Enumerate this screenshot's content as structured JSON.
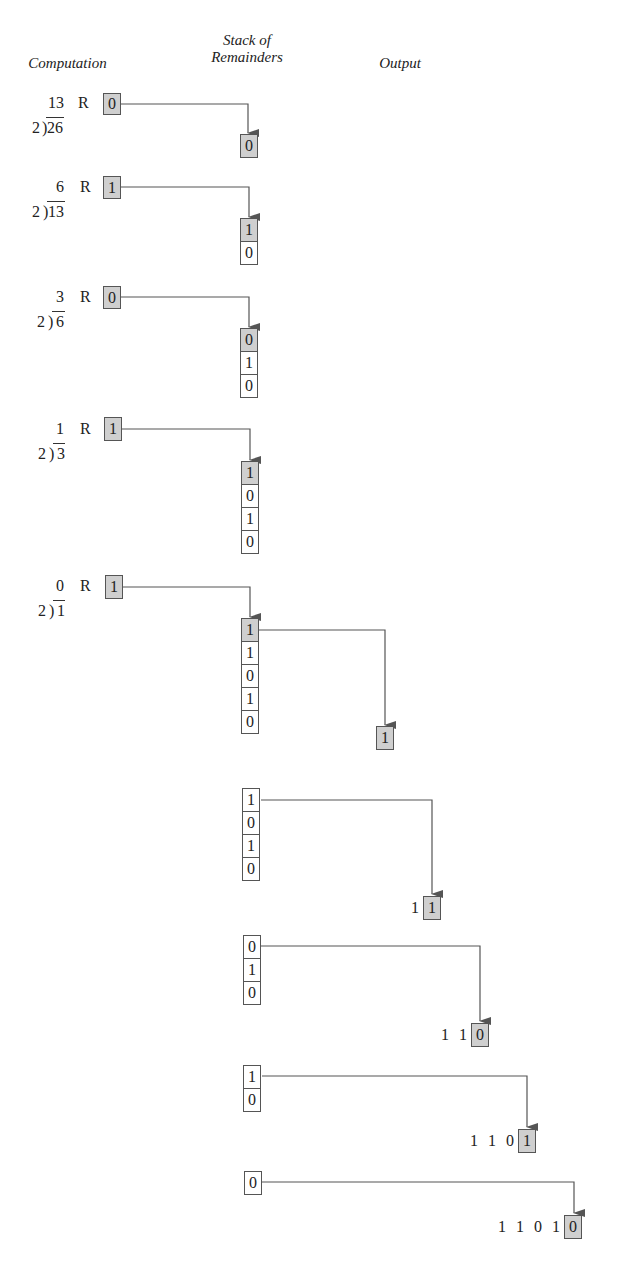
{
  "headers": {
    "computation": "Computation",
    "stack_line1": "Stack of",
    "stack_line2": "Remainders",
    "output": "Output"
  },
  "computations": [
    {
      "divisor": "2",
      "dividend": "26",
      "quotient": "13",
      "r_label": "R",
      "remainder": "0"
    },
    {
      "divisor": "2",
      "dividend": "13",
      "quotient": "6",
      "r_label": "R",
      "remainder": "1"
    },
    {
      "divisor": "2",
      "dividend": "6",
      "quotient": "3",
      "r_label": "R",
      "remainder": "0"
    },
    {
      "divisor": "2",
      "dividend": "3",
      "quotient": "1",
      "r_label": "R",
      "remainder": "1"
    },
    {
      "divisor": "2",
      "dividend": "1",
      "quotient": "0",
      "r_label": "R",
      "remainder": "1"
    }
  ],
  "push_stacks": [
    [
      "0"
    ],
    [
      "1",
      "0"
    ],
    [
      "0",
      "1",
      "0"
    ],
    [
      "1",
      "0",
      "1",
      "0"
    ],
    [
      "1",
      "1",
      "0",
      "1",
      "0"
    ]
  ],
  "pop_stacks": [
    [
      "1",
      "0",
      "1",
      "0"
    ],
    [
      "0",
      "1",
      "0"
    ],
    [
      "1",
      "0"
    ],
    [
      "0"
    ]
  ],
  "outputs": [
    {
      "prefix": "",
      "popped": "1"
    },
    {
      "prefix": "1",
      "popped": "1"
    },
    {
      "prefix": "1 1",
      "popped": "0"
    },
    {
      "prefix": "1 1 0",
      "popped": "1"
    },
    {
      "prefix": "1 1 0 1",
      "popped": "0"
    }
  ],
  "colors": {
    "shaded_box": "#cfcfcf",
    "line": "#555555",
    "text": "#222222"
  }
}
